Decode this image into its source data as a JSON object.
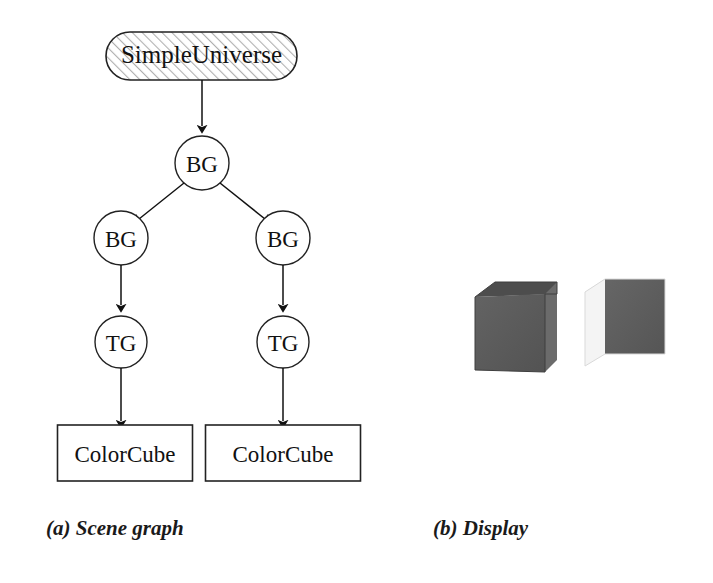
{
  "figure": {
    "background_color": "#ffffff",
    "ink_color": "#111111"
  },
  "scene_graph": {
    "caption": "(a) Scene graph",
    "root": {
      "label": "SimpleUniverse",
      "shape": "rounded-rectangle",
      "fill": "hatched",
      "hatch_color": "#b9b9b9"
    },
    "nodes": [
      {
        "id": "bg-root",
        "label": "BG",
        "shape": "circle",
        "level": 1
      },
      {
        "id": "bg-left",
        "label": "BG",
        "shape": "circle",
        "level": 2
      },
      {
        "id": "bg-right",
        "label": "BG",
        "shape": "circle",
        "level": 2
      },
      {
        "id": "tg-left",
        "label": "TG",
        "shape": "circle",
        "level": 3
      },
      {
        "id": "tg-right",
        "label": "TG",
        "shape": "circle",
        "level": 3
      },
      {
        "id": "cube-left",
        "label": "ColorCube",
        "shape": "rectangle",
        "level": 4
      },
      {
        "id": "cube-right",
        "label": "ColorCube",
        "shape": "rectangle",
        "level": 4
      }
    ],
    "edges": [
      {
        "from": "SimpleUniverse",
        "to": "bg-root"
      },
      {
        "from": "bg-root",
        "to": "bg-left"
      },
      {
        "from": "bg-root",
        "to": "bg-right"
      },
      {
        "from": "bg-left",
        "to": "tg-left"
      },
      {
        "from": "bg-right",
        "to": "tg-right"
      },
      {
        "from": "tg-left",
        "to": "cube-left"
      },
      {
        "from": "tg-right",
        "to": "cube-right"
      }
    ]
  },
  "display": {
    "caption": "(b) Display",
    "cubes": [
      {
        "id": "cube-render-left",
        "front_face_color": "#5a5a5a",
        "top_face_color": "#4b4b4b",
        "side_face_color": "#6e6e6e"
      },
      {
        "id": "cube-render-right",
        "front_face_color": "#5d5d5d",
        "top_face_color": "#f2f2f2",
        "side_face_color": "#f6f6f6"
      }
    ]
  }
}
